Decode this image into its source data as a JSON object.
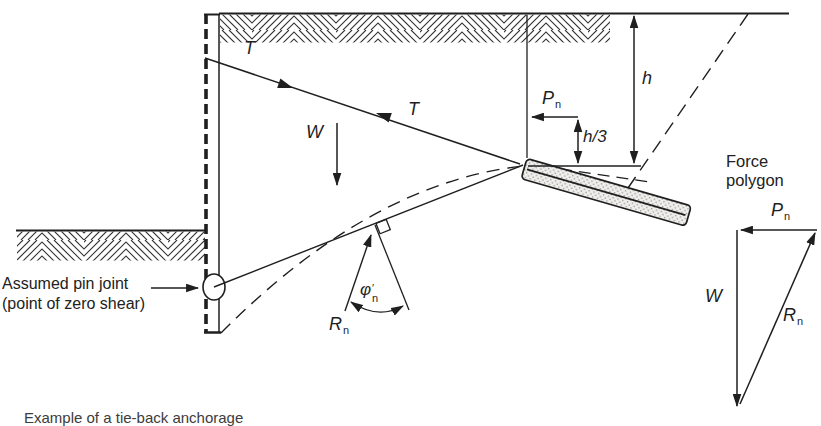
{
  "colors": {
    "ink": "#1f1f1f",
    "background": "#ffffff",
    "block_fill": "#f0efec",
    "block_dots": "#8f8f8f"
  },
  "labels": {
    "tie_upper": "T",
    "tie_lower": "T",
    "weight": "W",
    "height": "h",
    "height_third": "h/3",
    "pn_base": "P",
    "pn_sub": "n",
    "rn_base": "R",
    "rn_sub": "n",
    "phi_base": "φ",
    "phi_prime": "′",
    "phi_sub": "n"
  },
  "annotations": {
    "pin_joint_line1": "Assumed pin joint",
    "pin_joint_line2": "(point of zero shear)"
  },
  "force_polygon": {
    "title_line1": "Force",
    "title_line2": "polygon",
    "pn_base": "P",
    "pn_sub": "n",
    "w": "W",
    "rn_base": "R",
    "rn_sub": "n"
  },
  "caption_fragment": "Example of a tie-back anchorage"
}
